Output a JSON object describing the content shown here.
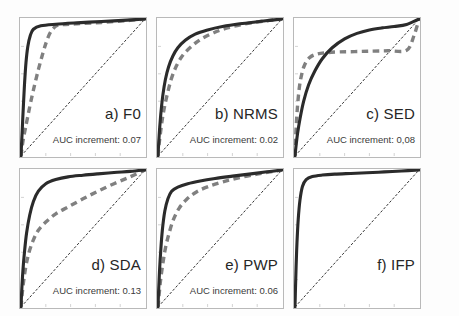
{
  "figure": {
    "type": "roc-curve-grid",
    "rows": 2,
    "columns": 3,
    "background_color": "#ffffff",
    "frame_color": "#b9b9b9"
  },
  "styles": {
    "solid_curve_color": "#2b2b2b",
    "dashed_curve_color": "#808080",
    "diagonal_color": "#1c1c1c",
    "solid_curve_label": "combined",
    "dashed_curve_label": "baseline",
    "diagonal_label": "chance"
  },
  "chart_data": {
    "type": "line",
    "title": "",
    "xlabel": "",
    "ylabel": "",
    "xlim": [
      0,
      1
    ],
    "ylim": [
      0,
      1
    ],
    "grid": false,
    "legend_position": "none",
    "xticks": [
      0,
      0.2,
      0.4,
      0.6,
      0.8,
      1.0
    ],
    "yticks": [
      0,
      0.2,
      0.4,
      0.6,
      0.8,
      1.0
    ],
    "panels": [
      {
        "id": "a",
        "label": "a) F0",
        "auc_text": "AUC increment: 0.07",
        "auc_value": 0.07,
        "has_dashed": true,
        "series": [
          {
            "name": "solid",
            "x": [
              0,
              0.004,
              0.009,
              0.014,
              0.02,
              0.028,
              0.04,
              0.055,
              0.075,
              0.1,
              0.16,
              0.28,
              0.45,
              0.65,
              0.82,
              1.0
            ],
            "y": [
              0,
              0.08,
              0.17,
              0.27,
              0.38,
              0.52,
              0.68,
              0.8,
              0.88,
              0.925,
              0.95,
              0.962,
              0.972,
              0.982,
              0.99,
              1.0
            ]
          },
          {
            "name": "dashed",
            "x": [
              0,
              0.008,
              0.02,
              0.035,
              0.055,
              0.08,
              0.11,
              0.14,
              0.17,
              0.2,
              0.23,
              0.26,
              0.3,
              0.45,
              0.65,
              0.85,
              1.0
            ],
            "y": [
              0,
              0.06,
              0.13,
              0.2,
              0.29,
              0.4,
              0.52,
              0.63,
              0.73,
              0.82,
              0.89,
              0.93,
              0.955,
              0.965,
              0.975,
              0.988,
              1.0
            ]
          }
        ]
      },
      {
        "id": "b",
        "label": "b) NRMS",
        "auc_text": "AUC increment: 0.02",
        "auc_value": 0.02,
        "has_dashed": true,
        "series": [
          {
            "name": "solid",
            "x": [
              0,
              0.006,
              0.014,
              0.025,
              0.04,
              0.06,
              0.085,
              0.12,
              0.16,
              0.22,
              0.3,
              0.4,
              0.52,
              0.66,
              0.8,
              0.9,
              1.0
            ],
            "y": [
              0,
              0.1,
              0.21,
              0.33,
              0.45,
              0.56,
              0.65,
              0.73,
              0.79,
              0.845,
              0.89,
              0.92,
              0.945,
              0.965,
              0.98,
              0.99,
              1.0
            ]
          },
          {
            "name": "dashed",
            "x": [
              0,
              0.008,
              0.02,
              0.035,
              0.055,
              0.08,
              0.11,
              0.15,
              0.2,
              0.27,
              0.35,
              0.45,
              0.56,
              0.68,
              0.8,
              0.9,
              1.0
            ],
            "y": [
              0,
              0.08,
              0.17,
              0.27,
              0.37,
              0.47,
              0.57,
              0.66,
              0.735,
              0.8,
              0.855,
              0.9,
              0.935,
              0.96,
              0.978,
              0.99,
              1.0
            ]
          }
        ]
      },
      {
        "id": "c",
        "label": "c) SED",
        "auc_text": "AUC increment: 0,08",
        "auc_value": 0.08,
        "has_dashed": true,
        "series": [
          {
            "name": "solid",
            "x": [
              0,
              0.008,
              0.02,
              0.04,
              0.07,
              0.11,
              0.16,
              0.22,
              0.3,
              0.4,
              0.5,
              0.6,
              0.7,
              0.8,
              0.9,
              1.0
            ],
            "y": [
              0,
              0.07,
              0.16,
              0.27,
              0.4,
              0.52,
              0.62,
              0.71,
              0.79,
              0.855,
              0.895,
              0.92,
              0.935,
              0.945,
              0.96,
              1.0
            ]
          },
          {
            "name": "dashed",
            "x": [
              0,
              0.004,
              0.01,
              0.02,
              0.035,
              0.055,
              0.08,
              0.12,
              0.18,
              0.26,
              0.36,
              0.48,
              0.6,
              0.75,
              0.9,
              0.96,
              1.0
            ],
            "y": [
              0,
              0.1,
              0.22,
              0.36,
              0.5,
              0.6,
              0.67,
              0.72,
              0.745,
              0.755,
              0.76,
              0.762,
              0.765,
              0.768,
              0.772,
              0.88,
              1.0
            ]
          }
        ]
      },
      {
        "id": "d",
        "label": "d) SDA",
        "auc_text": "AUC increment: 0.13",
        "auc_value": 0.13,
        "has_dashed": true,
        "series": [
          {
            "name": "solid",
            "x": [
              0,
              0.006,
              0.015,
              0.028,
              0.045,
              0.07,
              0.1,
              0.14,
              0.2,
              0.28,
              0.38,
              0.5,
              0.62,
              0.75,
              0.88,
              1.0
            ],
            "y": [
              0,
              0.12,
              0.26,
              0.4,
              0.54,
              0.67,
              0.77,
              0.845,
              0.9,
              0.93,
              0.95,
              0.962,
              0.972,
              0.982,
              0.99,
              1.0
            ]
          },
          {
            "name": "dashed",
            "x": [
              0,
              0.008,
              0.02,
              0.04,
              0.065,
              0.1,
              0.14,
              0.2,
              0.28,
              0.38,
              0.5,
              0.62,
              0.75,
              0.88,
              1.0
            ],
            "y": [
              0,
              0.08,
              0.18,
              0.3,
              0.4,
              0.49,
              0.56,
              0.62,
              0.68,
              0.73,
              0.79,
              0.845,
              0.9,
              0.95,
              1.0
            ]
          }
        ]
      },
      {
        "id": "e",
        "label": "e) PWP",
        "auc_text": "AUC increment: 0.06",
        "auc_value": 0.06,
        "has_dashed": true,
        "series": [
          {
            "name": "solid",
            "x": [
              0,
              0.005,
              0.012,
              0.022,
              0.035,
              0.055,
              0.08,
              0.11,
              0.16,
              0.24,
              0.34,
              0.46,
              0.6,
              0.75,
              0.88,
              1.0
            ],
            "y": [
              0,
              0.12,
              0.26,
              0.41,
              0.56,
              0.7,
              0.79,
              0.845,
              0.875,
              0.9,
              0.92,
              0.938,
              0.955,
              0.972,
              0.987,
              1.0
            ]
          },
          {
            "name": "dashed",
            "x": [
              0,
              0.008,
              0.02,
              0.038,
              0.06,
              0.09,
              0.125,
              0.17,
              0.23,
              0.31,
              0.41,
              0.53,
              0.66,
              0.8,
              0.92,
              1.0
            ],
            "y": [
              0,
              0.08,
              0.19,
              0.31,
              0.43,
              0.54,
              0.64,
              0.72,
              0.785,
              0.84,
              0.88,
              0.915,
              0.945,
              0.97,
              0.988,
              1.0
            ]
          }
        ]
      },
      {
        "id": "f",
        "label": "f) IFP",
        "auc_text": "",
        "auc_value": null,
        "has_dashed": false,
        "series": [
          {
            "name": "solid",
            "x": [
              0,
              0.004,
              0.009,
              0.016,
              0.026,
              0.04,
              0.06,
              0.09,
              0.14,
              0.22,
              0.32,
              0.45,
              0.58,
              0.72,
              0.86,
              1.0
            ],
            "y": [
              0,
              0.14,
              0.3,
              0.47,
              0.64,
              0.78,
              0.88,
              0.93,
              0.952,
              0.963,
              0.97,
              0.975,
              0.98,
              0.986,
              0.993,
              1.0
            ]
          }
        ]
      }
    ]
  }
}
